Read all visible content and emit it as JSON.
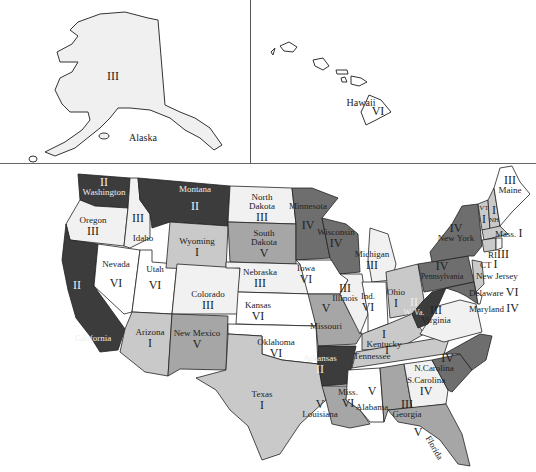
{
  "colors": {
    "I": "#c9c9c9",
    "II": "#3c3c3c",
    "III": "#f1f1f1",
    "IV": "#6e6e6e",
    "V": "#a6a6a6",
    "VI": "#ffffff",
    "outline": "#222222"
  },
  "insets": {
    "alaska": {
      "name": "Alaska",
      "class": "III"
    },
    "hawaii": {
      "name": "Hawaii",
      "class": "VI"
    }
  },
  "states": [
    {
      "name": "Washington",
      "class": "II"
    },
    {
      "name": "Oregon",
      "class": "III"
    },
    {
      "name": "California",
      "class": "II"
    },
    {
      "name": "Idaho",
      "class": "III"
    },
    {
      "name": "Nevada",
      "class": "VI"
    },
    {
      "name": "Utah",
      "class": "VI"
    },
    {
      "name": "Arizona",
      "class": "I"
    },
    {
      "name": "Montana",
      "class": "II"
    },
    {
      "name": "Wyoming",
      "class": "I"
    },
    {
      "name": "Colorado",
      "class": "III"
    },
    {
      "name": "New Mexico",
      "class": "V"
    },
    {
      "name": "North Dakota",
      "class": "III"
    },
    {
      "name": "South Dakota",
      "class": "V"
    },
    {
      "name": "Nebraska",
      "class": "III"
    },
    {
      "name": "Kansas",
      "class": "VI"
    },
    {
      "name": "Oklahoma",
      "class": "VI"
    },
    {
      "name": "Texas",
      "class": "I"
    },
    {
      "name": "Minnesota",
      "class": "IV"
    },
    {
      "name": "Iowa",
      "class": "VI"
    },
    {
      "name": "Missouri",
      "class": "V"
    },
    {
      "name": "Arkansas",
      "class": "II"
    },
    {
      "name": "Louisiana",
      "class": "V"
    },
    {
      "name": "Wisconsin",
      "class": "IV"
    },
    {
      "name": "Illinois",
      "class": "III"
    },
    {
      "name": "Michigan",
      "class": "III"
    },
    {
      "name": "Ind.",
      "class": "VI"
    },
    {
      "name": "Ohio",
      "class": "I"
    },
    {
      "name": "Kentucky",
      "class": "I"
    },
    {
      "name": "Tennessee",
      "class": "I"
    },
    {
      "name": "Miss.",
      "class": "VI"
    },
    {
      "name": "Alabama",
      "class": "V"
    },
    {
      "name": "Georgia",
      "class": "III"
    },
    {
      "name": "Florida",
      "class": "V"
    },
    {
      "name": "S.Carolina",
      "class": "IV"
    },
    {
      "name": "N.Carolina",
      "class": "IV"
    },
    {
      "name": "Virginia",
      "class": "III"
    },
    {
      "name": "W. Va.",
      "class": "II"
    },
    {
      "name": "Pennsylvania",
      "class": "IV"
    },
    {
      "name": "New York",
      "class": "IV"
    },
    {
      "name": "VT",
      "class": "I"
    },
    {
      "name": "NH",
      "class": "I"
    },
    {
      "name": "Maine",
      "class": "III"
    },
    {
      "name": "Mass.",
      "class": "I"
    },
    {
      "name": "RI",
      "class": "III"
    },
    {
      "name": "CT",
      "class": "I"
    },
    {
      "name": "New Jersey",
      "class": "I"
    },
    {
      "name": "Delaware",
      "class": "VI"
    },
    {
      "name": "Maryland",
      "class": "IV"
    }
  ]
}
